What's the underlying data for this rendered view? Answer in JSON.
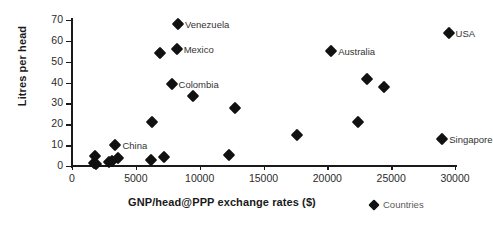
{
  "chart_data": {
    "type": "scatter",
    "title": "",
    "xlabel": "GNP/head@PPP exchange rates ($)",
    "ylabel": "Litres per head",
    "xlim": [
      0,
      30000
    ],
    "ylim": [
      0,
      70
    ],
    "xticks": [
      0,
      5000,
      10000,
      15000,
      20000,
      25000,
      30000
    ],
    "yticks": [
      0,
      10,
      20,
      30,
      40,
      50,
      60,
      70
    ],
    "grid": false,
    "legend": {
      "position": "bottom-right",
      "entries": [
        "Countries"
      ]
    },
    "series": [
      {
        "name": "Countries",
        "marker": "diamond",
        "color": "#111111",
        "points": [
          {
            "x": 1700,
            "y": 1.5,
            "label": ""
          },
          {
            "x": 1800,
            "y": 5.0,
            "label": ""
          },
          {
            "x": 1900,
            "y": 0.8,
            "label": ""
          },
          {
            "x": 2900,
            "y": 1.8,
            "label": ""
          },
          {
            "x": 3100,
            "y": 2.2,
            "label": ""
          },
          {
            "x": 3600,
            "y": 3.8,
            "label": ""
          },
          {
            "x": 3400,
            "y": 10.2,
            "label": "China"
          },
          {
            "x": 6200,
            "y": 3.0,
            "label": ""
          },
          {
            "x": 7200,
            "y": 4.4,
            "label": ""
          },
          {
            "x": 6300,
            "y": 21.0,
            "label": ""
          },
          {
            "x": 6900,
            "y": 54.0,
            "label": ""
          },
          {
            "x": 7800,
            "y": 39.5,
            "label": "Colombia"
          },
          {
            "x": 8200,
            "y": 56.0,
            "label": "Mexico"
          },
          {
            "x": 8300,
            "y": 68.0,
            "label": "Venezuela"
          },
          {
            "x": 9500,
            "y": 33.5,
            "label": ""
          },
          {
            "x": 12300,
            "y": 5.2,
            "label": ""
          },
          {
            "x": 12800,
            "y": 28.0,
            "label": ""
          },
          {
            "x": 17600,
            "y": 15.0,
            "label": ""
          },
          {
            "x": 20300,
            "y": 55.0,
            "label": "Australia"
          },
          {
            "x": 22400,
            "y": 21.0,
            "label": ""
          },
          {
            "x": 23100,
            "y": 41.5,
            "label": ""
          },
          {
            "x": 24400,
            "y": 38.0,
            "label": ""
          },
          {
            "x": 29000,
            "y": 13.0,
            "label": "Singapore"
          },
          {
            "x": 29500,
            "y": 64.0,
            "label": "USA"
          }
        ]
      }
    ]
  },
  "legend": {
    "countries_label": "Countries"
  },
  "axes": {
    "x_title": "GNP/head@PPP exchange rates ($)",
    "y_title": "Litres per head"
  }
}
